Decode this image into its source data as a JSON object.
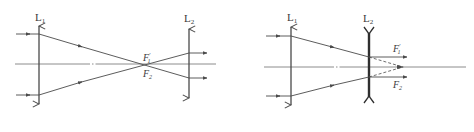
{
  "figure": {
    "colors": {
      "stroke": "#4a4a4a",
      "axis": "#707070",
      "background": "#ffffff"
    },
    "left_diagram": {
      "description": "Two converging lenses sharing focal point (Keplerian arrangement)",
      "lens1": {
        "label_main": "L",
        "label_sub": "1",
        "type": "converging"
      },
      "lens2": {
        "label_main": "L",
        "label_sub": "2",
        "type": "converging"
      },
      "focus_upper": {
        "main": "F",
        "sub": "1",
        "prime": "′"
      },
      "focus_lower": {
        "main": "F",
        "sub": "2"
      }
    },
    "right_diagram": {
      "description": "Converging lens followed by diverging lens (Galilean arrangement)",
      "lens1": {
        "label_main": "L",
        "label_sub": "1",
        "type": "converging"
      },
      "lens2": {
        "label_main": "L",
        "label_sub": "2",
        "type": "diverging"
      },
      "focus_upper": {
        "main": "F",
        "sub": "1",
        "prime": "′"
      },
      "focus_lower": {
        "main": "F",
        "sub": "2"
      }
    }
  }
}
